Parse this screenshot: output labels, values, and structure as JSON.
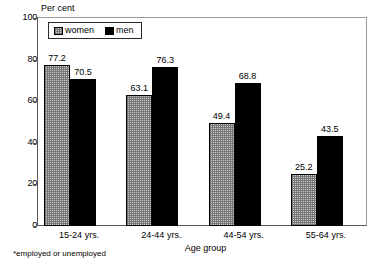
{
  "chart_data": {
    "type": "bar",
    "title": "",
    "ylabel": "Per cent",
    "xlabel": "Age group",
    "categories": [
      "15-24 yrs.",
      "24-44 yrs.",
      "44-54 yrs.",
      "55-64 yrs."
    ],
    "series": [
      {
        "name": "women",
        "values": [
          77.2,
          63.1,
          49.4,
          25.2
        ],
        "pattern": "checkerboard",
        "color": "#cfcfcf"
      },
      {
        "name": "men",
        "values": [
          70.5,
          76.3,
          68.8,
          43.5
        ],
        "pattern": "solid",
        "color": "#000000"
      }
    ],
    "ylim": [
      0,
      100
    ],
    "yticks": [
      0,
      20,
      40,
      60,
      80,
      100
    ],
    "ytick_labels": [
      "0",
      "20",
      "40",
      "60",
      "80",
      "100"
    ],
    "grid": false,
    "legend_position": "top-left-inside",
    "footnote": "*employed or unemployed"
  },
  "axis": {
    "y_title": "Per cent",
    "x_title": "Age group",
    "ticks": [
      {
        "label": "100",
        "value": 100
      },
      {
        "label": "80",
        "value": 80
      },
      {
        "label": "60",
        "value": 60
      },
      {
        "label": "40",
        "value": 40
      },
      {
        "label": "20",
        "value": 20
      },
      {
        "label": "0",
        "value": 0
      }
    ]
  },
  "legend": {
    "items": [
      {
        "label": "women",
        "swatch": "pattern-checker"
      },
      {
        "label": "men",
        "swatch": "solid-black"
      }
    ]
  },
  "groups": [
    {
      "label": "15-24 yrs.",
      "women": {
        "value": 77.2,
        "label": "77.2"
      },
      "men": {
        "value": 70.5,
        "label": "70.5"
      }
    },
    {
      "label": "24-44 yrs.",
      "women": {
        "value": 63.1,
        "label": "63.1"
      },
      "men": {
        "value": 76.3,
        "label": "76.3"
      }
    },
    {
      "label": "44-54 yrs.",
      "women": {
        "value": 49.4,
        "label": "49.4"
      },
      "men": {
        "value": 68.8,
        "label": "68.8"
      }
    },
    {
      "label": "55-64 yrs.",
      "women": {
        "value": 25.2,
        "label": "25.2"
      },
      "men": {
        "value": 43.5,
        "label": "43.5"
      }
    }
  ],
  "footnote": {
    "text": "*employed or unemployed"
  }
}
